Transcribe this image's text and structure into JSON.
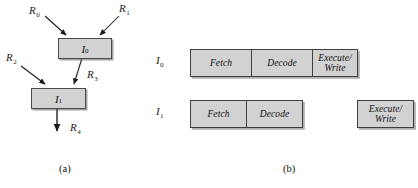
{
  "figure": {
    "caption_a": "(a)",
    "caption_b": "(b)",
    "box_fill": "#d2d2d2",
    "box_stroke": "#3f3f3f",
    "text_color": "#111111"
  },
  "panel_a": {
    "title": "data dependency graph",
    "nodes": [
      {
        "id": "I0",
        "base": "I",
        "sub": "0"
      },
      {
        "id": "I1",
        "base": "I",
        "sub": "1"
      }
    ],
    "registers": [
      {
        "id": "R0",
        "base": "R",
        "sub": "0",
        "role": "input to I0"
      },
      {
        "id": "R1",
        "base": "R",
        "sub": "1",
        "role": "input to I0"
      },
      {
        "id": "R2",
        "base": "R",
        "sub": "2",
        "role": "input to I1"
      },
      {
        "id": "R3",
        "base": "R",
        "sub": "3",
        "role": "output of I0, input to I1"
      },
      {
        "id": "R4",
        "base": "R",
        "sub": "4",
        "role": "output of I1"
      }
    ]
  },
  "panel_b": {
    "title": "pipeline timing diagram",
    "rows": [
      {
        "label_base": "I",
        "label_sub": "0",
        "stages": [
          {
            "name": "Fetch",
            "line1": "Fetch",
            "line2": ""
          },
          {
            "name": "Decode",
            "line1": "Decode",
            "line2": ""
          },
          {
            "name": "Execute/Write",
            "line1": "Execute/",
            "line2": "Write"
          }
        ]
      },
      {
        "label_base": "I",
        "label_sub": "1",
        "stages": [
          {
            "name": "Fetch",
            "line1": "Fetch",
            "line2": ""
          },
          {
            "name": "Decode",
            "line1": "Decode",
            "line2": ""
          },
          {
            "name": "Execute/Write",
            "line1": "Execute/",
            "line2": "Write"
          }
        ]
      }
    ]
  }
}
